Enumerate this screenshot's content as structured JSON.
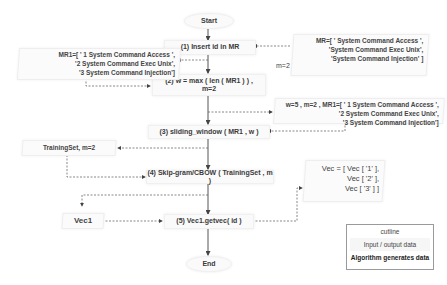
{
  "flow": {
    "start": "Start",
    "step1": "(1) Insert id in MR",
    "step2_line1": "(2) w = max ( len ( MR1 ) ) ,",
    "step2_line2": "m=2",
    "step3": "(3) sliding_window ( MR1 , w )",
    "step4": "(4) Skip-gram/CBOW ( TrainingSet , m )",
    "step5": "(5) Vec1.getvec( id )",
    "end": "End"
  },
  "data_boxes": {
    "mr_input": {
      "lines": [
        "MR=[ ' System Command Access ',",
        "'System Command Exec Unix',",
        "'System Command Injection' ]"
      ],
      "m": "m=2"
    },
    "mr1": {
      "lines": [
        "MR1=[ ' 1 System Command Access ',",
        "'2 System Command Exec Unix',",
        "'3 System Command Injection']"
      ]
    },
    "window_params": {
      "lines": [
        "w=5 , m=2 , MR1=[ ' 1 System Command Access ',",
        "'2 System Command Exec Unix',",
        "'3 System Command Injection']"
      ]
    },
    "training_set": {
      "label": "TrainingSet, m=2"
    },
    "vec_output": {
      "lines": [
        "Vec = [ Vec [  '1'  ],",
        "Vec [  '2'  ],",
        "Vec [  '3'  ] ]"
      ]
    },
    "vec1": {
      "label": "Vec1"
    }
  },
  "legend": {
    "title": "cutline",
    "input_output": "Input / output data",
    "algorithm": "Algorithm generates data"
  },
  "colors": {
    "arrow_solid": "#555555",
    "arrow_dashed": "#6a6a6a",
    "box_bg": "#fafafa"
  }
}
